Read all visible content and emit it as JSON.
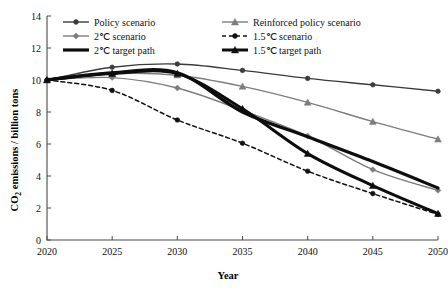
{
  "chart_data": {
    "type": "line",
    "title": "",
    "xlabel": "Year",
    "ylabel": "CO2 emissions / billion tons",
    "ylabel_parts": {
      "prefix": "CO",
      "sub": "2",
      "suffix": " emissions / billion tons"
    },
    "x": [
      2020,
      2025,
      2030,
      2035,
      2040,
      2045,
      2050
    ],
    "xticklabels": [
      "2020",
      "2025",
      "2030",
      "2035",
      "2040",
      "2045",
      "2050"
    ],
    "yticklabels": [
      "0",
      "2",
      "4",
      "6",
      "8",
      "10",
      "12",
      "14"
    ],
    "yticks": [
      0,
      2,
      4,
      6,
      8,
      10,
      12,
      14
    ],
    "xlim": [
      2020,
      2050
    ],
    "ylim": [
      0,
      14
    ],
    "grid": false,
    "legend_position": "top",
    "series": [
      {
        "name": "Policy scenario",
        "key": "policy",
        "values": [
          10.0,
          10.8,
          11.0,
          10.6,
          10.1,
          9.7,
          9.3
        ],
        "color": "#3b3b3b",
        "marker": "circle",
        "dash": "none",
        "width": 1.4
      },
      {
        "name": "Reinforced policy scenario",
        "key": "reinforced",
        "values": [
          10.0,
          10.4,
          10.3,
          9.6,
          8.6,
          7.4,
          6.3
        ],
        "color": "#7d7d7d",
        "marker": "triangle",
        "dash": "none",
        "width": 1.4
      },
      {
        "name": "2℃ scenario",
        "key": "two_deg",
        "values": [
          10.0,
          10.15,
          9.5,
          8.1,
          6.5,
          4.4,
          3.1
        ],
        "color": "#7d7d7d",
        "marker": "diamond",
        "dash": "none",
        "width": 1.4
      },
      {
        "name": "1.5℃ scenario",
        "key": "onefive_deg",
        "values": [
          10.0,
          9.35,
          7.5,
          6.05,
          4.3,
          2.9,
          1.6
        ],
        "color": "#111111",
        "marker": "circle",
        "dash": "4,3",
        "width": 1.5
      },
      {
        "name": "2℃ target path",
        "key": "two_deg_target",
        "values": [
          10.0,
          10.45,
          10.45,
          8.0,
          6.45,
          4.9,
          3.25
        ],
        "color": "#0d0d0d",
        "marker": "none",
        "dash": "none",
        "width": 3.2
      },
      {
        "name": "1.5℃ target path",
        "key": "onefive_deg_target",
        "values": [
          10.0,
          10.4,
          10.4,
          8.2,
          5.4,
          3.4,
          1.65
        ],
        "color": "#0d0d0d",
        "marker": "triangle",
        "dash": "none",
        "width": 3.0
      }
    ]
  },
  "legend": {
    "column_left": [
      {
        "label": "Policy scenario",
        "series_key": "policy"
      },
      {
        "label": "2℃ scenario",
        "series_key": "two_deg"
      },
      {
        "label": "2℃ target  path",
        "series_key": "two_deg_target"
      }
    ],
    "column_right": [
      {
        "label": "Reinforced policy scenario",
        "series_key": "reinforced"
      },
      {
        "label": "1.5℃ scenario",
        "series_key": "onefive_deg"
      },
      {
        "label": "1.5℃ target  path",
        "series_key": "onefive_deg_target"
      }
    ]
  },
  "colors": {
    "axis": "#4a4a4a",
    "dark": "#3b3b3b",
    "gray": "#7d7d7d",
    "black": "#0d0d0d",
    "background": "#ffffff"
  }
}
